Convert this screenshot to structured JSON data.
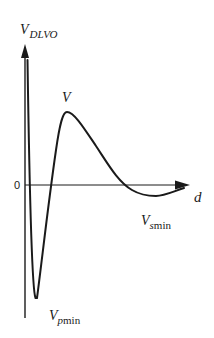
{
  "diagram": {
    "y_axis": {
      "label_main": "V",
      "label_sub": "DLVO"
    },
    "x_axis": {
      "label": "d",
      "origin_label": "0"
    },
    "annotations": {
      "barrier": {
        "main": "V",
        "sub": ""
      },
      "secondary_min": {
        "main": "V",
        "sub_italic": "s",
        "sub_upright": "min"
      },
      "primary_min": {
        "main": "V",
        "sub_italic": "p",
        "sub_upright": "min"
      }
    },
    "colors": {
      "line": "#1a1a1a",
      "background": "#ffffff"
    }
  }
}
